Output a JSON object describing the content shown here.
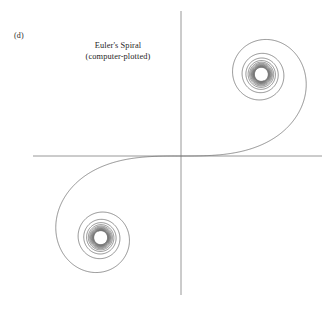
{
  "figure": {
    "panel_label": "(d)",
    "title": "Euler's Spiral",
    "subtitle": "(computer-plotted)",
    "background_color": "#ffffff",
    "curve_color": "#6d6d6d",
    "axis_color": "#8d8d8d",
    "text_color": "#262626"
  },
  "chart_data": {
    "type": "line",
    "title": "Euler's Spiral",
    "subtitle": "(computer-plotted)",
    "annotations": [
      "(d)",
      "Euler's Spiral",
      "(computer-plotted)"
    ],
    "curve_name": "Euler spiral (Cornu spiral / clothoid)",
    "parametric_definition": {
      "x_of_t": "C(t) = integral_0^t cos(pi*u^2/2) du",
      "y_of_t": "S(t) = integral_0^t sin(pi*u^2/2) du",
      "parameter": "t",
      "t_range": [
        -7.5,
        7.5
      ],
      "samples": 3000
    },
    "asymptotic_points": [
      {
        "name": "upper-right-center",
        "x": 0.5,
        "y": 0.5
      },
      {
        "name": "lower-left-center",
        "x": -0.5,
        "y": -0.5
      }
    ],
    "xlabel": "",
    "ylabel": "",
    "xlim": [
      -0.9,
      0.9
    ],
    "ylim": [
      -0.87,
      0.87
    ],
    "grid": false,
    "legend": false,
    "axes": {
      "x_axis_visible": true,
      "y_axis_visible": true,
      "origin_px": [
        181,
        156
      ],
      "x_axis_span_px": [
        33,
        322
      ],
      "y_axis_span_px": [
        11,
        295
      ]
    }
  }
}
